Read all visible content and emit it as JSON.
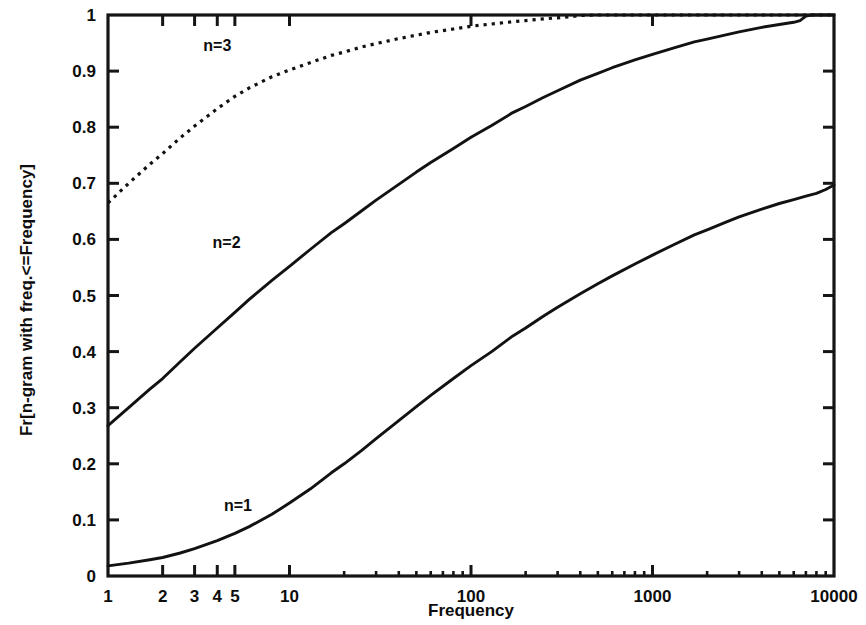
{
  "chart_data": {
    "type": "line",
    "title": "",
    "xlabel": "Frequency",
    "ylabel": "Fr[n-gram with freq.<=Frequency]",
    "xscale": "log",
    "yscale": "linear",
    "xlim": [
      1,
      10000
    ],
    "ylim": [
      0,
      1
    ],
    "grid": false,
    "legend_position": "inline-annotations",
    "x_ticks": [
      {
        "value": 1,
        "label": "1"
      },
      {
        "value": 2,
        "label": "2"
      },
      {
        "value": 3,
        "label": "3"
      },
      {
        "value": 4,
        "label": "4"
      },
      {
        "value": 5,
        "label": "5"
      },
      {
        "value": 10,
        "label": "10"
      },
      {
        "value": 100,
        "label": "100"
      },
      {
        "value": 1000,
        "label": "1000"
      },
      {
        "value": 10000,
        "label": "10000"
      }
    ],
    "y_ticks": [
      {
        "value": 0,
        "label": "0"
      },
      {
        "value": 0.1,
        "label": "0.1"
      },
      {
        "value": 0.2,
        "label": "0.2"
      },
      {
        "value": 0.3,
        "label": "0.3"
      },
      {
        "value": 0.4,
        "label": "0.4"
      },
      {
        "value": 0.5,
        "label": "0.5"
      },
      {
        "value": 0.6,
        "label": "0.6"
      },
      {
        "value": 0.7,
        "label": "0.7"
      },
      {
        "value": 0.8,
        "label": "0.8"
      },
      {
        "value": 0.9,
        "label": "0.9"
      },
      {
        "value": 1,
        "label": "1"
      }
    ],
    "series": [
      {
        "name": "n=1",
        "style": "solid",
        "color": "#121212",
        "annotation": {
          "text": "n=1",
          "x": 5.2,
          "y": 0.115
        },
        "x": [
          1,
          1.3,
          1.7,
          2,
          2.5,
          3,
          4,
          5,
          6,
          8,
          10,
          13,
          17,
          20,
          25,
          30,
          40,
          50,
          60,
          80,
          100,
          130,
          170,
          200,
          250,
          300,
          400,
          500,
          600,
          800,
          1000,
          1300,
          1700,
          2000,
          2500,
          3000,
          4000,
          5000,
          6000,
          7000,
          8000,
          9000,
          10000
        ],
        "y": [
          0.018,
          0.023,
          0.029,
          0.033,
          0.041,
          0.049,
          0.063,
          0.076,
          0.088,
          0.11,
          0.13,
          0.155,
          0.184,
          0.2,
          0.224,
          0.245,
          0.277,
          0.302,
          0.322,
          0.352,
          0.375,
          0.4,
          0.428,
          0.442,
          0.463,
          0.479,
          0.503,
          0.521,
          0.535,
          0.556,
          0.572,
          0.59,
          0.608,
          0.617,
          0.63,
          0.64,
          0.654,
          0.664,
          0.671,
          0.677,
          0.682,
          0.689,
          0.697
        ]
      },
      {
        "name": "n=2",
        "style": "dashed-fine",
        "color": "#121212",
        "annotation": {
          "text": "n=2",
          "x": 4.5,
          "y": 0.585
        },
        "x": [
          1,
          1.3,
          1.7,
          2,
          2.5,
          3,
          4,
          5,
          6,
          8,
          10,
          13,
          17,
          20,
          25,
          30,
          40,
          50,
          60,
          80,
          100,
          130,
          170,
          200,
          250,
          300,
          400,
          500,
          600,
          800,
          1000,
          1300,
          1700,
          2000,
          2500,
          3000,
          4000,
          5000,
          6000,
          6500,
          7000,
          7500,
          8000,
          10000
        ],
        "y": [
          0.268,
          0.3,
          0.333,
          0.352,
          0.382,
          0.406,
          0.442,
          0.47,
          0.493,
          0.527,
          0.552,
          0.582,
          0.612,
          0.628,
          0.651,
          0.67,
          0.698,
          0.72,
          0.737,
          0.762,
          0.782,
          0.803,
          0.826,
          0.837,
          0.853,
          0.865,
          0.884,
          0.896,
          0.906,
          0.92,
          0.93,
          0.941,
          0.952,
          0.957,
          0.964,
          0.97,
          0.978,
          0.983,
          0.987,
          0.99,
          0.998,
          1.0,
          1.0,
          1.0
        ]
      },
      {
        "name": "n=3",
        "style": "dotted",
        "color": "#121212",
        "annotation": {
          "text": "n=3",
          "x": 4.0,
          "y": 0.935
        },
        "x": [
          1,
          1.3,
          1.7,
          2,
          2.5,
          3,
          4,
          5,
          6,
          8,
          10,
          13,
          17,
          20,
          25,
          30,
          40,
          50,
          60,
          80,
          100,
          130,
          170,
          200,
          250,
          300,
          350,
          400,
          500,
          1000,
          10000
        ],
        "y": [
          0.665,
          0.7,
          0.734,
          0.753,
          0.781,
          0.802,
          0.833,
          0.855,
          0.87,
          0.89,
          0.902,
          0.915,
          0.928,
          0.934,
          0.943,
          0.949,
          0.958,
          0.964,
          0.969,
          0.975,
          0.98,
          0.984,
          0.988,
          0.99,
          0.993,
          0.995,
          0.997,
          0.999,
          1.0,
          1.0,
          1.0
        ]
      }
    ]
  },
  "axis": {
    "x_title": "Frequency",
    "y_title": "Fr[n-gram with freq.<=Frequency]"
  }
}
